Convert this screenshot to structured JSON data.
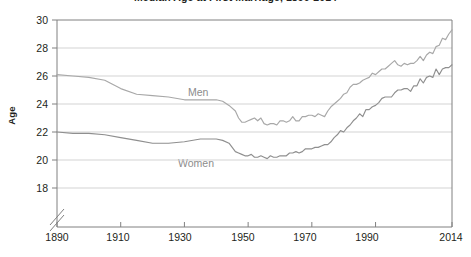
{
  "chart": {
    "title": "Median Age at First Marriage, 1890-2014",
    "title_visible": false,
    "axis_title_y": "Age"
  },
  "chart_data": {
    "type": "line",
    "title": "Median Age at First Marriage, 1890-2014",
    "xlabel": "",
    "ylabel": "Age",
    "xlim": [
      1890,
      2014
    ],
    "ylim": [
      17,
      30
    ],
    "ytick_labels": [
      "18",
      "20",
      "22",
      "24",
      "26",
      "28",
      "30"
    ],
    "ytick_values": [
      18,
      20,
      22,
      24,
      26,
      28,
      30
    ],
    "xtick_labels": [
      "1890",
      "1910",
      "1930",
      "1950",
      "1970",
      "1990",
      "2014"
    ],
    "xtick_values": [
      1890,
      1910,
      1930,
      1950,
      1970,
      1990,
      2014
    ],
    "grid": "horizontal",
    "y_axis_break": true,
    "legend": "inline-labels",
    "colors": {
      "men": "#a8a8a8",
      "women": "#8f8f8f",
      "grid": "#d3d3d3",
      "frame": "#808080"
    },
    "series": [
      {
        "name": "Men",
        "label_position": {
          "x": 1932,
          "y": 25.9
        },
        "x": [
          1890,
          1895,
          1900,
          1905,
          1910,
          1915,
          1920,
          1925,
          1930,
          1935,
          1940,
          1942,
          1944,
          1946,
          1947,
          1948,
          1949,
          1950,
          1951,
          1952,
          1953,
          1954,
          1955,
          1956,
          1957,
          1958,
          1959,
          1960,
          1961,
          1962,
          1963,
          1964,
          1965,
          1966,
          1967,
          1968,
          1969,
          1970,
          1971,
          1972,
          1973,
          1974,
          1975,
          1976,
          1977,
          1978,
          1979,
          1980,
          1981,
          1982,
          1983,
          1984,
          1985,
          1986,
          1987,
          1988,
          1989,
          1990,
          1991,
          1992,
          1993,
          1994,
          1995,
          1996,
          1997,
          1998,
          1999,
          2000,
          2001,
          2002,
          2003,
          2004,
          2005,
          2006,
          2007,
          2008,
          2009,
          2010,
          2011,
          2012,
          2013,
          2014
        ],
        "values": [
          26.1,
          26.0,
          25.9,
          25.7,
          25.1,
          24.7,
          24.6,
          24.5,
          24.3,
          24.3,
          24.3,
          24.2,
          23.9,
          23.5,
          23.0,
          22.7,
          22.7,
          22.8,
          22.9,
          23.0,
          22.8,
          23.0,
          22.6,
          22.5,
          22.6,
          22.6,
          22.5,
          22.8,
          22.8,
          22.7,
          22.8,
          23.1,
          22.8,
          22.8,
          23.1,
          23.1,
          23.2,
          23.2,
          23.1,
          23.3,
          23.2,
          23.1,
          23.5,
          23.8,
          24.0,
          24.2,
          24.4,
          24.7,
          24.8,
          25.2,
          25.4,
          25.4,
          25.5,
          25.7,
          25.8,
          25.9,
          26.2,
          26.1,
          26.3,
          26.5,
          26.5,
          26.7,
          26.9,
          27.1,
          26.8,
          26.7,
          26.9,
          26.8,
          26.9,
          26.9,
          27.1,
          27.4,
          27.1,
          27.5,
          27.7,
          27.6,
          28.1,
          28.2,
          28.7,
          28.6,
          29.0,
          29.3
        ]
      },
      {
        "name": "Women",
        "label_position": {
          "x": 1928,
          "y": 20.9
        },
        "x": [
          1890,
          1895,
          1900,
          1905,
          1910,
          1915,
          1920,
          1925,
          1930,
          1935,
          1940,
          1942,
          1944,
          1946,
          1947,
          1948,
          1949,
          1950,
          1951,
          1952,
          1953,
          1954,
          1955,
          1956,
          1957,
          1958,
          1959,
          1960,
          1961,
          1962,
          1963,
          1964,
          1965,
          1966,
          1967,
          1968,
          1969,
          1970,
          1971,
          1972,
          1973,
          1974,
          1975,
          1976,
          1977,
          1978,
          1979,
          1980,
          1981,
          1982,
          1983,
          1984,
          1985,
          1986,
          1987,
          1988,
          1989,
          1990,
          1991,
          1992,
          1993,
          1994,
          1995,
          1996,
          1997,
          1998,
          1999,
          2000,
          2001,
          2002,
          2003,
          2004,
          2005,
          2006,
          2007,
          2008,
          2009,
          2010,
          2011,
          2012,
          2013,
          2014
        ],
        "values": [
          22.0,
          21.9,
          21.9,
          21.8,
          21.6,
          21.4,
          21.2,
          21.2,
          21.3,
          21.5,
          21.5,
          21.4,
          21.2,
          20.6,
          20.5,
          20.4,
          20.3,
          20.3,
          20.4,
          20.2,
          20.2,
          20.3,
          20.2,
          20.1,
          20.3,
          20.2,
          20.2,
          20.3,
          20.3,
          20.3,
          20.5,
          20.5,
          20.6,
          20.5,
          20.6,
          20.8,
          20.8,
          20.8,
          20.9,
          20.9,
          21.0,
          21.1,
          21.1,
          21.3,
          21.6,
          21.8,
          22.1,
          22.0,
          22.3,
          22.5,
          22.8,
          23.0,
          23.3,
          23.1,
          23.6,
          23.6,
          23.8,
          23.9,
          24.1,
          24.4,
          24.5,
          24.5,
          24.5,
          24.8,
          25.0,
          25.0,
          25.1,
          25.1,
          24.9,
          25.3,
          25.3,
          25.8,
          25.5,
          25.9,
          26.0,
          25.9,
          26.5,
          26.1,
          26.5,
          26.6,
          26.6,
          26.8
        ]
      }
    ]
  }
}
